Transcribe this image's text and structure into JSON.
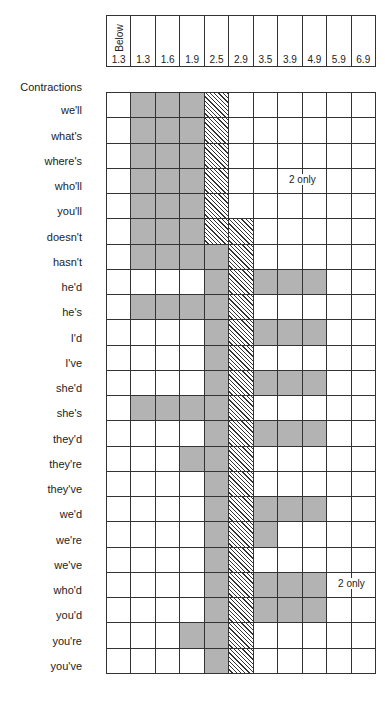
{
  "chart_data": {
    "type": "heatmap",
    "title": "Contractions",
    "header_top_label": "Below",
    "columns": [
      "Below 1.3",
      "1.3",
      "1.6",
      "1.9",
      "2.5",
      "2.9",
      "3.5",
      "3.9",
      "4.9",
      "5.9",
      "6.9"
    ],
    "column_tick_labels": [
      "1.3",
      "1.3",
      "1.6",
      "1.9",
      "2.5",
      "2.9",
      "3.5",
      "3.9",
      "4.9",
      "5.9",
      "6.9"
    ],
    "legend": {
      "0": "blank",
      "1": "shaded (gray)",
      "2": "hatched"
    },
    "rows": [
      {
        "label": "we'll",
        "cells": [
          0,
          1,
          1,
          1,
          2,
          0,
          0,
          0,
          0,
          0,
          0
        ]
      },
      {
        "label": "what's",
        "cells": [
          0,
          1,
          1,
          1,
          2,
          0,
          0,
          0,
          0,
          0,
          0
        ]
      },
      {
        "label": "where's",
        "cells": [
          0,
          1,
          1,
          1,
          2,
          0,
          0,
          0,
          0,
          0,
          0
        ]
      },
      {
        "label": "who'll",
        "cells": [
          0,
          1,
          1,
          1,
          2,
          0,
          0,
          0,
          0,
          0,
          0
        ],
        "note": "2 only",
        "note_col": 8
      },
      {
        "label": "you'll",
        "cells": [
          0,
          1,
          1,
          1,
          2,
          0,
          0,
          0,
          0,
          0,
          0
        ]
      },
      {
        "label": "doesn't",
        "cells": [
          0,
          1,
          1,
          1,
          2,
          2,
          0,
          0,
          0,
          0,
          0
        ]
      },
      {
        "label": "hasn't",
        "cells": [
          0,
          1,
          1,
          1,
          1,
          2,
          0,
          0,
          0,
          0,
          0
        ]
      },
      {
        "label": "he'd",
        "cells": [
          0,
          0,
          0,
          0,
          1,
          2,
          1,
          1,
          1,
          0,
          0
        ]
      },
      {
        "label": "he's",
        "cells": [
          0,
          1,
          1,
          1,
          1,
          2,
          0,
          0,
          0,
          0,
          0
        ]
      },
      {
        "label": "I'd",
        "cells": [
          0,
          0,
          0,
          0,
          1,
          2,
          1,
          1,
          1,
          0,
          0
        ]
      },
      {
        "label": "I've",
        "cells": [
          0,
          0,
          0,
          0,
          1,
          2,
          0,
          0,
          0,
          0,
          0
        ]
      },
      {
        "label": "she'd",
        "cells": [
          0,
          0,
          0,
          0,
          1,
          2,
          1,
          1,
          1,
          0,
          0
        ]
      },
      {
        "label": "she's",
        "cells": [
          0,
          1,
          1,
          1,
          1,
          2,
          0,
          0,
          0,
          0,
          0
        ]
      },
      {
        "label": "they'd",
        "cells": [
          0,
          0,
          0,
          0,
          1,
          2,
          1,
          1,
          1,
          0,
          0
        ]
      },
      {
        "label": "they're",
        "cells": [
          0,
          0,
          0,
          1,
          1,
          2,
          0,
          0,
          0,
          0,
          0
        ]
      },
      {
        "label": "they've",
        "cells": [
          0,
          0,
          0,
          0,
          1,
          2,
          0,
          0,
          0,
          0,
          0
        ]
      },
      {
        "label": "we'd",
        "cells": [
          0,
          0,
          0,
          0,
          1,
          2,
          1,
          1,
          1,
          0,
          0
        ]
      },
      {
        "label": "we're",
        "cells": [
          0,
          0,
          0,
          0,
          1,
          2,
          1,
          0,
          0,
          0,
          0
        ]
      },
      {
        "label": "we've",
        "cells": [
          0,
          0,
          0,
          0,
          1,
          2,
          0,
          0,
          0,
          0,
          0
        ]
      },
      {
        "label": "who'd",
        "cells": [
          0,
          0,
          0,
          0,
          1,
          2,
          1,
          1,
          1,
          0,
          0
        ],
        "note": "2 only",
        "note_col": 10
      },
      {
        "label": "you'd",
        "cells": [
          0,
          0,
          0,
          0,
          1,
          2,
          1,
          1,
          1,
          0,
          0
        ]
      },
      {
        "label": "you're",
        "cells": [
          0,
          0,
          0,
          1,
          1,
          2,
          0,
          0,
          0,
          0,
          0
        ]
      },
      {
        "label": "you've",
        "cells": [
          0,
          0,
          0,
          0,
          1,
          2,
          0,
          0,
          0,
          0,
          0
        ]
      }
    ],
    "colors": {
      "shaded": "#b3b3b3",
      "hatch_line": "#333333",
      "grid_line": "#333333"
    }
  }
}
